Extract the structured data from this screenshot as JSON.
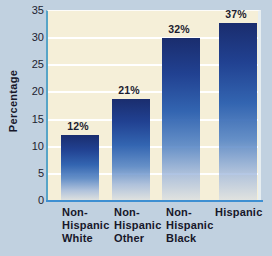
{
  "colors": {
    "page_bg": "#c1d1e0",
    "plot_bg": "#f5efd8",
    "gridline": "#ffffff",
    "axis_left": "#57a4c7",
    "axis_bottom": "#3e8fd2",
    "bar_top": "#1a2d6e",
    "bar_mid": "#2f62b0",
    "bar_bottom_fade": "#cbd6e9",
    "text": "#17172a"
  },
  "chart_data": {
    "type": "bar",
    "title": "",
    "xlabel": "",
    "ylabel": "Percentage",
    "categories": [
      [
        "Non-",
        "Hispanic",
        "White"
      ],
      [
        "Non-",
        "Hispanic",
        "Other"
      ],
      [
        "Non-",
        "Hispanic",
        "Black"
      ],
      [
        "Hispanic"
      ]
    ],
    "values": [
      12,
      21,
      32,
      37
    ],
    "bar_value_labels": [
      "12%",
      "21%",
      "32%",
      "37%"
    ],
    "yticks": [
      0,
      5,
      10,
      15,
      20,
      25,
      30,
      35
    ],
    "ylim": [
      0,
      35
    ],
    "grid": true,
    "legend": false,
    "drawn_values": [
      12.2,
      18.8,
      30.0,
      32.8
    ]
  }
}
